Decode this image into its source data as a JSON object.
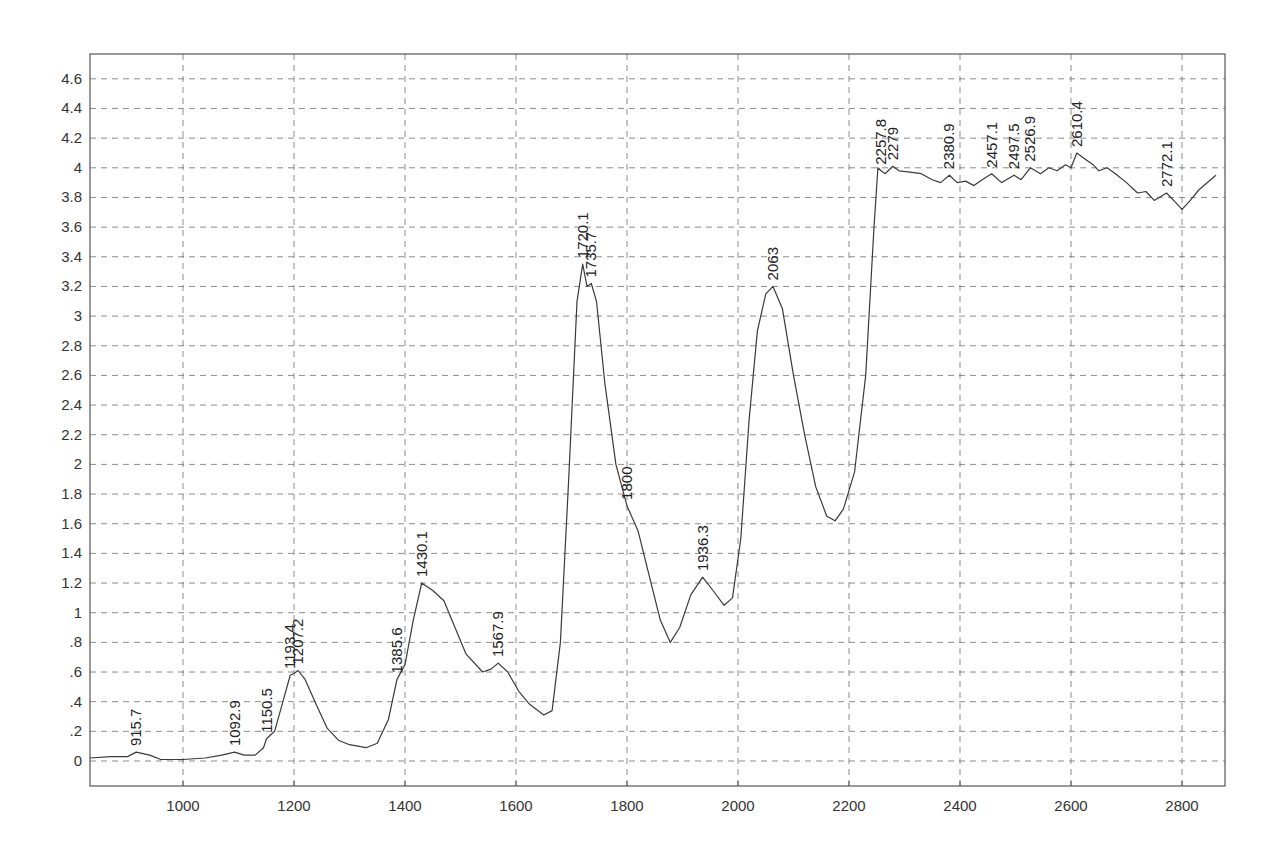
{
  "chart_data": {
    "type": "line",
    "title": "",
    "xlabel": "",
    "ylabel": "",
    "xlim": [
      832,
      2861
    ],
    "ylim": [
      -0.17,
      4.75
    ],
    "grid": true,
    "legend": null,
    "x_ticks": [
      1000,
      1200,
      1400,
      1600,
      1800,
      2000,
      2200,
      2400,
      2600,
      2800
    ],
    "x_tick_labels": [
      "1000",
      "1200",
      "1400",
      "1600",
      "1800",
      "2000",
      "2200",
      "2400",
      "2600",
      "2800"
    ],
    "y_ticks": [
      0,
      0.2,
      0.4,
      0.6,
      0.8,
      1,
      1.2,
      1.4,
      1.6,
      1.8,
      2,
      2.2,
      2.4,
      2.6,
      2.8,
      3,
      3.2,
      3.4,
      3.6,
      3.8,
      4,
      4.2,
      4.4,
      4.6
    ],
    "y_tick_labels": [
      "0",
      ".2",
      ".4",
      ".6",
      ".8",
      "1",
      "1.2",
      "1.4",
      "1.6",
      "1.8",
      "2",
      "2.2",
      "2.4",
      "2.6",
      "2.8",
      "3",
      "3.2",
      "3.4",
      "3.6",
      "3.8",
      "4",
      "4.2",
      "4.4",
      "4.6"
    ],
    "series": [
      {
        "name": "spectrum",
        "color": "#3a3a3a",
        "x": [
          832,
          870,
          900,
          915.7,
          940,
          960,
          1000,
          1040,
          1070,
          1092.9,
          1110,
          1130,
          1145,
          1150.5,
          1165,
          1180,
          1193.4,
          1200,
          1207.2,
          1220,
          1240,
          1260,
          1280,
          1300,
          1330,
          1350,
          1370,
          1385.6,
          1400,
          1415,
          1430.1,
          1450,
          1470,
          1490,
          1510,
          1540,
          1555,
          1567.9,
          1585,
          1605,
          1625,
          1650,
          1665,
          1680,
          1695,
          1710,
          1720.1,
          1728,
          1735.7,
          1745,
          1760,
          1780,
          1800,
          1820,
          1840,
          1860,
          1878,
          1895,
          1915,
          1936.3,
          1955,
          1975,
          1990,
          2005,
          2020,
          2035,
          2050,
          2063,
          2080,
          2100,
          2120,
          2140,
          2160,
          2175,
          2190,
          2210,
          2230,
          2245,
          2252,
          2257.8,
          2265,
          2279,
          2290,
          2310,
          2330,
          2350,
          2365,
          2380.9,
          2395,
          2410,
          2425,
          2440,
          2457.1,
          2475,
          2497.5,
          2510,
          2526.9,
          2545,
          2560,
          2575,
          2590,
          2600,
          2610.4,
          2625,
          2640,
          2650,
          2665,
          2680,
          2700,
          2720,
          2735,
          2750,
          2772.1,
          2790,
          2800,
          2815,
          2830,
          2861
        ],
        "y": [
          0.02,
          0.03,
          0.03,
          0.06,
          0.04,
          0.01,
          0.01,
          0.02,
          0.04,
          0.06,
          0.04,
          0.04,
          0.09,
          0.15,
          0.2,
          0.4,
          0.58,
          0.59,
          0.61,
          0.55,
          0.38,
          0.22,
          0.14,
          0.11,
          0.09,
          0.12,
          0.28,
          0.55,
          0.65,
          0.95,
          1.2,
          1.15,
          1.08,
          0.9,
          0.72,
          0.6,
          0.62,
          0.66,
          0.6,
          0.47,
          0.38,
          0.31,
          0.34,
          0.8,
          1.9,
          3.1,
          3.35,
          3.2,
          3.22,
          3.1,
          2.55,
          2.0,
          1.72,
          1.55,
          1.25,
          0.95,
          0.8,
          0.9,
          1.12,
          1.24,
          1.15,
          1.05,
          1.1,
          1.5,
          2.3,
          2.9,
          3.15,
          3.2,
          3.05,
          2.6,
          2.2,
          1.85,
          1.65,
          1.62,
          1.7,
          1.95,
          2.6,
          3.6,
          4.0,
          3.98,
          3.96,
          4.01,
          3.98,
          3.97,
          3.96,
          3.92,
          3.9,
          3.95,
          3.9,
          3.91,
          3.88,
          3.92,
          3.96,
          3.9,
          3.95,
          3.92,
          4.0,
          3.96,
          4.0,
          3.98,
          4.02,
          4.0,
          4.1,
          4.06,
          4.02,
          3.98,
          4.0,
          3.96,
          3.9,
          3.83,
          3.84,
          3.78,
          3.83,
          3.76,
          3.72,
          3.78,
          3.85,
          3.95
        ]
      }
    ],
    "annotations": [
      {
        "text": "915.7",
        "x": 915.7,
        "y": 0.06
      },
      {
        "text": "1092.9",
        "x": 1092.9,
        "y": 0.06
      },
      {
        "text": "1150.5",
        "x": 1150.5,
        "y": 0.15
      },
      {
        "text": "1193.4",
        "x": 1193.4,
        "y": 0.58
      },
      {
        "text": "1207.2",
        "x": 1207.2,
        "y": 0.61
      },
      {
        "text": "1385.6",
        "x": 1385.6,
        "y": 0.55
      },
      {
        "text": "1430.1",
        "x": 1430.1,
        "y": 1.2
      },
      {
        "text": "1567.9",
        "x": 1567.9,
        "y": 0.66
      },
      {
        "text": "1720.1",
        "x": 1720.1,
        "y": 3.35
      },
      {
        "text": "1735.7",
        "x": 1735.7,
        "y": 3.22
      },
      {
        "text": "1800",
        "x": 1800,
        "y": 1.72
      },
      {
        "text": "1936.3",
        "x": 1936.3,
        "y": 1.24
      },
      {
        "text": "2063",
        "x": 2063,
        "y": 3.2
      },
      {
        "text": "2257.8",
        "x": 2257.8,
        "y": 3.98
      },
      {
        "text": "2279",
        "x": 2279,
        "y": 4.01
      },
      {
        "text": "2380.9",
        "x": 2380.9,
        "y": 3.95
      },
      {
        "text": "2457.1",
        "x": 2457.1,
        "y": 3.96
      },
      {
        "text": "2497.5",
        "x": 2497.5,
        "y": 3.95
      },
      {
        "text": "2526.9",
        "x": 2526.9,
        "y": 4.0
      },
      {
        "text": "2610.4",
        "x": 2610.4,
        "y": 4.1
      },
      {
        "text": "2772.1",
        "x": 2772.1,
        "y": 3.83
      }
    ]
  }
}
